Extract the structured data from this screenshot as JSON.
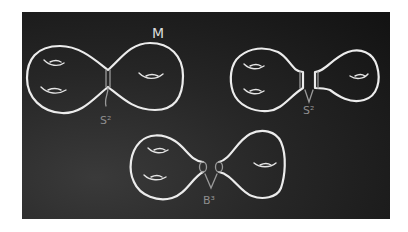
{
  "figure": {
    "medium": "chalkboard",
    "colors": {
      "board": "#1e1e1e",
      "chalk": "#ececec",
      "label_dim": "#8e8e8e",
      "page": "#ffffff"
    }
  },
  "panels": [
    {
      "id": "top-left",
      "label_surface": "M",
      "label_cut": "S²",
      "left_holes": 2,
      "right_holes": 1,
      "state": "joined by neck"
    },
    {
      "id": "top-right",
      "label_cut": "S²",
      "left_holes": 2,
      "right_holes": 1,
      "state": "neck cut along sphere"
    },
    {
      "id": "bottom",
      "label_cut": "B³",
      "left_holes": 2,
      "right_holes": 1,
      "state": "capped with balls"
    }
  ],
  "labels": {
    "surface": "M",
    "sphere_top_left": "S²",
    "sphere_top_right": "S²",
    "ball_bottom": "B³"
  }
}
